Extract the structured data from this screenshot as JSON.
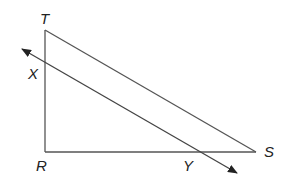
{
  "diagram": {
    "type": "geometry",
    "stroke_color": "#444444",
    "points": {
      "T": {
        "label": "T",
        "x": 45,
        "y": 30
      },
      "R": {
        "label": "R",
        "x": 45,
        "y": 152
      },
      "S": {
        "label": "S",
        "x": 256,
        "y": 152
      },
      "X": {
        "label": "X",
        "x": 45,
        "y": 62
      },
      "Y": {
        "label": "Y",
        "x": 198,
        "y": 152
      }
    },
    "segments": [
      {
        "from": "T",
        "to": "R"
      },
      {
        "from": "R",
        "to": "S"
      },
      {
        "from": "T",
        "to": "S"
      }
    ],
    "line": {
      "through": [
        "X",
        "Y"
      ],
      "arrows": "both",
      "start": [
        22,
        49
      ],
      "end": [
        237,
        173
      ]
    }
  }
}
